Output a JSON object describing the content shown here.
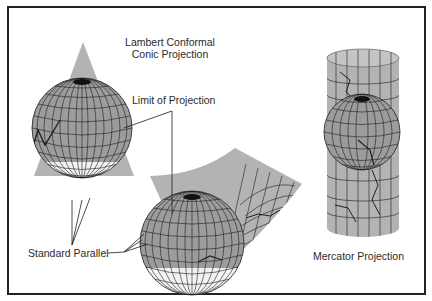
{
  "diagram": {
    "title_line1": "Lambert Conformal",
    "title_line2": "Conic Projection",
    "label_limit": "Limit of Projection",
    "label_standard_parallel": "Standard Parallel",
    "label_mercator": "Mercator Projection"
  },
  "colors": {
    "surface_gray": "#b3b3b3",
    "globe_gray": "#9a9a9a",
    "grid_line": "#1e1e1e",
    "border": "#222222"
  }
}
